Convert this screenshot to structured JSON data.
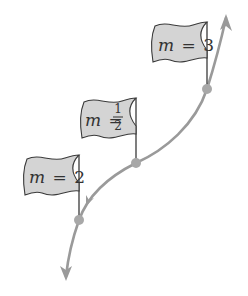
{
  "diagram": {
    "colors": {
      "curve": "#9a9a9a",
      "point": "#a8a8a8",
      "flag_fill": "#d4d4d4",
      "flag_stroke": "#3a3a3a",
      "pole": "#3a3a3a",
      "text": "#333333",
      "background": "#ffffff"
    },
    "flags": [
      {
        "variable": "m",
        "equals": "=",
        "value": "3"
      },
      {
        "variable": "m",
        "equals": "=",
        "numerator": "1",
        "denominator": "2"
      },
      {
        "variable": "m",
        "equals": "=",
        "value": "2"
      }
    ],
    "points": [
      {
        "label": "point-slope-3",
        "x": 207,
        "y": 89
      },
      {
        "label": "point-slope-half",
        "x": 136,
        "y": 163
      },
      {
        "label": "point-slope-2",
        "x": 79,
        "y": 220
      }
    ],
    "curve_arrows": [
      "arrow-up-right",
      "arrow-down-left",
      "mid-arrow-down"
    ]
  }
}
